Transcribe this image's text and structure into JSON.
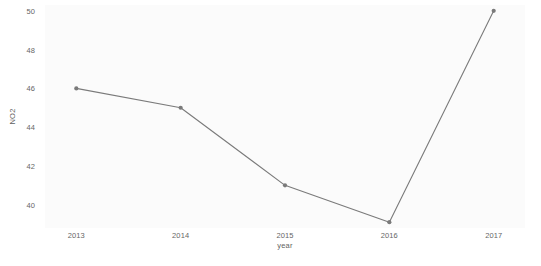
{
  "chart_data": {
    "type": "line",
    "title": "",
    "subtitle": "",
    "xlabel": "year",
    "ylabel": "NO2",
    "categories": [
      2013,
      2014,
      2015,
      2016,
      2017
    ],
    "x_tick_labels": [
      "2013",
      "2014",
      "2015",
      "2016",
      "2017"
    ],
    "y_tick_labels": [
      "40",
      "42",
      "44",
      "46",
      "48",
      "50"
    ],
    "y_ticks": [
      40,
      42,
      44,
      46,
      48,
      50
    ],
    "values": [
      46,
      45,
      41,
      39.1,
      50
    ],
    "series": [
      {
        "name": "NO2",
        "values": [
          46,
          45,
          41,
          39.1,
          50
        ]
      }
    ],
    "xlim": [
      2012.7,
      2017.3
    ],
    "ylim": [
      38.8,
      50.3
    ],
    "grid": false,
    "legend": "none",
    "marker": "circle",
    "line_color": "#7a7a7a",
    "marker_color": "#7a7a7a",
    "panel_background": "#fbfbfb",
    "axis_text_color": "#666666",
    "axis_title_color": "#5f5f5f"
  }
}
